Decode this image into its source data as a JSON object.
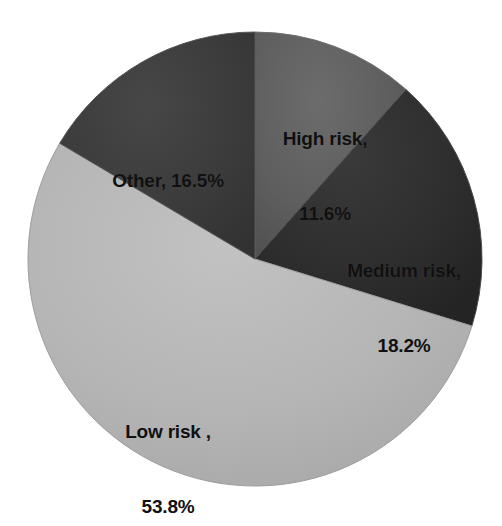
{
  "chart_data": {
    "type": "pie",
    "title": "",
    "subtitle": "",
    "xlabel": "",
    "ylabel": "",
    "legend_position": "none",
    "grid": false,
    "labels_inside_slices": true,
    "total_percent": 100.1,
    "categories": [
      "High risk",
      "Medium risk",
      "Low risk",
      "Other"
    ],
    "values": [
      11.6,
      18.2,
      53.8,
      16.5
    ],
    "unit": "%",
    "start_angle_deg": 0,
    "direction": "clockwise",
    "slices": [
      {
        "name": "High risk",
        "value": 11.6,
        "value_text": "11.6%",
        "label_line1": "High risk,",
        "label_line2": "11.6%",
        "color": "#5e5e5e",
        "angle_deg": 41.8,
        "start_deg": 0,
        "end_deg": 41.8
      },
      {
        "name": "Medium risk",
        "value": 18.2,
        "value_text": "18.2%",
        "label_line1": "Medium risk,",
        "label_line2": "18.2%",
        "color": "#2e2e2e",
        "angle_deg": 65.5,
        "start_deg": 41.8,
        "end_deg": 107.3
      },
      {
        "name": "Low risk",
        "value": 53.8,
        "value_text": "53.8%",
        "label_line1": "Low risk ,",
        "label_line2": "53.8%",
        "color": "#b5b5b5",
        "angle_deg": 193.7,
        "start_deg": 107.3,
        "end_deg": 301.0
      },
      {
        "name": "Other",
        "value": 16.5,
        "value_text": "16.5%",
        "label_line1": "Other, 16.5%",
        "label_line2": "",
        "color": "#3b3b3b",
        "angle_deg": 59.4,
        "start_deg": 301.0,
        "end_deg": 360.4
      }
    ],
    "geometry": {
      "center_x": 255,
      "center_y": 259,
      "radius": 227
    },
    "colors": {
      "background": "#ffffff",
      "label_text": "#101010",
      "slice_edge": "#6f6f6f"
    }
  }
}
